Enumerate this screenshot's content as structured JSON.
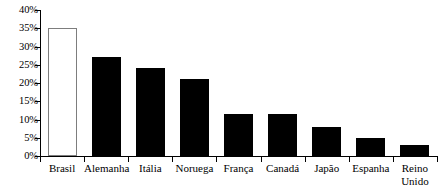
{
  "chart_data": {
    "type": "bar",
    "title": "",
    "subtitle": "",
    "xlabel": "",
    "ylabel": "",
    "categories": [
      "Brasil",
      "Alemanha",
      "Itália",
      "Noruega",
      "França",
      "Canadá",
      "Japão",
      "Espanha",
      "Reino Unido"
    ],
    "values": [
      35,
      27,
      24,
      21,
      11.5,
      11.5,
      8,
      5,
      3
    ],
    "ylim": [
      0,
      40
    ],
    "ytick_values": [
      0,
      5,
      10,
      15,
      20,
      25,
      30,
      35,
      40
    ],
    "ytick_labels": [
      "0%",
      "5%",
      "10%",
      "15%",
      "20%",
      "25%",
      "30%",
      "35%",
      "40%"
    ],
    "grid": false,
    "legend": null,
    "series": [
      {
        "name": "",
        "values": [
          35,
          27,
          24,
          21,
          11.5,
          11.5,
          8,
          5,
          3
        ]
      }
    ],
    "bar_styles": [
      "outlined",
      "filled",
      "filled",
      "filled",
      "filled",
      "filled",
      "filled",
      "filled",
      "filled"
    ],
    "colors": {
      "bar_fill": "#000000",
      "highlight_fill": "#ffffff",
      "highlight_stroke": "#7d7d7d",
      "axis": "#000000",
      "text": "#000000",
      "background": "#ffffff"
    },
    "annotations": []
  }
}
